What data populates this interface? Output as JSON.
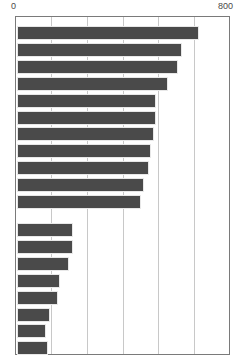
{
  "chart_data": {
    "type": "bar",
    "orientation": "horizontal",
    "title": "",
    "xlabel": "",
    "ylabel": "",
    "xlim": [
      0,
      800
    ],
    "ylim": null,
    "grid": true,
    "legend": null,
    "bar_color": "#4a4a4a",
    "frame_color": "#7a7a7a",
    "gridline_color": "#c8c8c8",
    "axis_tick_labels": [
      "0",
      "800"
    ],
    "axis_ticks": [
      0,
      800
    ],
    "gridline_values": [
      133,
      267,
      400,
      533,
      667
    ],
    "categories": [
      "",
      "",
      "",
      "",
      "",
      "",
      "",
      "",
      "",
      "",
      "",
      "",
      "",
      "",
      "",
      "",
      "",
      "",
      ""
    ],
    "values": [
      684,
      621,
      603,
      569,
      521,
      521,
      514,
      502,
      495,
      476,
      465,
      212,
      212,
      197,
      160,
      153,
      123,
      108,
      115
    ],
    "groups": [
      {
        "name": "upper-group",
        "count": 11,
        "values": [
          684,
          621,
          603,
          569,
          521,
          521,
          514,
          502,
          495,
          476,
          465
        ]
      },
      {
        "name": "lower-group",
        "count": 8,
        "values": [
          212,
          212,
          197,
          160,
          153,
          123,
          108,
          115
        ]
      }
    ]
  },
  "layout": {
    "plot_left_px": 15,
    "plot_top_px": 16,
    "plot_width_px": 215,
    "plot_height_px": 339,
    "bar_height_px": 14,
    "bar_gap_px": 2.9,
    "group_gap_px": 19,
    "upper_group_start_px": 9,
    "lower_group_start_px": 206
  }
}
